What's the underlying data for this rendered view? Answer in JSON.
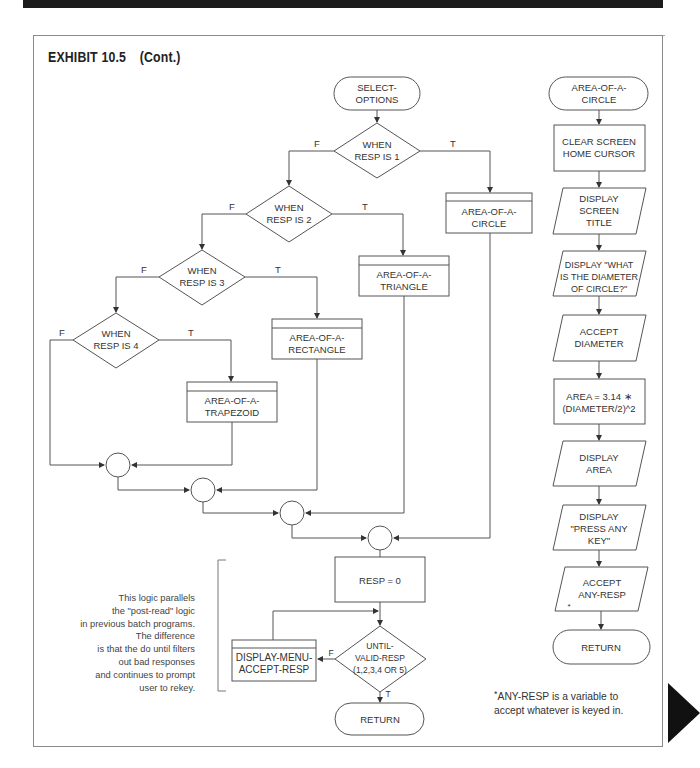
{
  "header": {
    "title": "",
    "bar_color": "#1c1c1c"
  },
  "exhibit": {
    "label": "EXHIBIT 10.5",
    "cont": "(Cont.)"
  },
  "select_options": {
    "start": [
      "SELECT-",
      "OPTIONS"
    ],
    "decisions": [
      {
        "lines": [
          "WHEN",
          "RESP IS 1"
        ],
        "false_label": "F",
        "true_label": "T"
      },
      {
        "lines": [
          "WHEN",
          "RESP IS 2"
        ],
        "false_label": "F",
        "true_label": "T"
      },
      {
        "lines": [
          "WHEN",
          "RESP IS 3"
        ],
        "false_label": "F",
        "true_label": "T"
      },
      {
        "lines": [
          "WHEN",
          "RESP IS 4"
        ],
        "false_label": "F",
        "true_label": "T"
      }
    ],
    "modules": [
      {
        "lines": [
          "AREA-OF-A-",
          "CIRCLE"
        ]
      },
      {
        "lines": [
          "AREA-OF-A-",
          "TRIANGLE"
        ]
      },
      {
        "lines": [
          "AREA-OF-A-",
          "RECTANGLE"
        ]
      },
      {
        "lines": [
          "AREA-OF-A-",
          "TRAPEZOID"
        ]
      }
    ],
    "reset": "RESP = 0",
    "until": {
      "lines": [
        "UNTIL-",
        "VALID-RESP",
        "(1,2,3,4 OR 5)"
      ],
      "false_label": "F",
      "true_label": "T"
    },
    "loop_module": [
      "DISPLAY-MENU-",
      "ACCEPT-RESP"
    ],
    "end": "RETURN",
    "note": [
      "This logic parallels",
      "the \"post-read\" logic",
      "in previous batch programs.",
      "The difference",
      "is that the do until filters",
      "out bad responses",
      "and continues to prompt",
      "user to rekey."
    ]
  },
  "area_of_a_circle": {
    "start": [
      "AREA-OF-A-",
      "CIRCLE"
    ],
    "steps": [
      {
        "type": "process",
        "lines": [
          "CLEAR SCREEN",
          "HOME CURSOR"
        ]
      },
      {
        "type": "io",
        "lines": [
          "DISPLAY",
          "SCREEN",
          "TITLE"
        ]
      },
      {
        "type": "io",
        "lines": [
          "DISPLAY \"WHAT",
          "IS THE DIAMETER",
          "OF CIRCLE?\""
        ]
      },
      {
        "type": "io",
        "lines": [
          "ACCEPT",
          "DIAMETER"
        ]
      },
      {
        "type": "process",
        "lines": [
          "AREA = 3.14 ∗",
          "(DIAMETER/2)^2"
        ]
      },
      {
        "type": "io",
        "lines": [
          "DISPLAY",
          "AREA"
        ]
      },
      {
        "type": "io",
        "lines": [
          "DISPLAY",
          "\"PRESS ANY",
          "KEY\""
        ]
      },
      {
        "type": "io",
        "lines": [
          "ACCEPT",
          "ANY-RESP"
        ],
        "mark": "*"
      }
    ],
    "end": "RETURN"
  },
  "footnote": {
    "mark": "*",
    "lines": [
      "ANY-RESP is a variable to",
      "accept whatever is keyed in."
    ]
  }
}
